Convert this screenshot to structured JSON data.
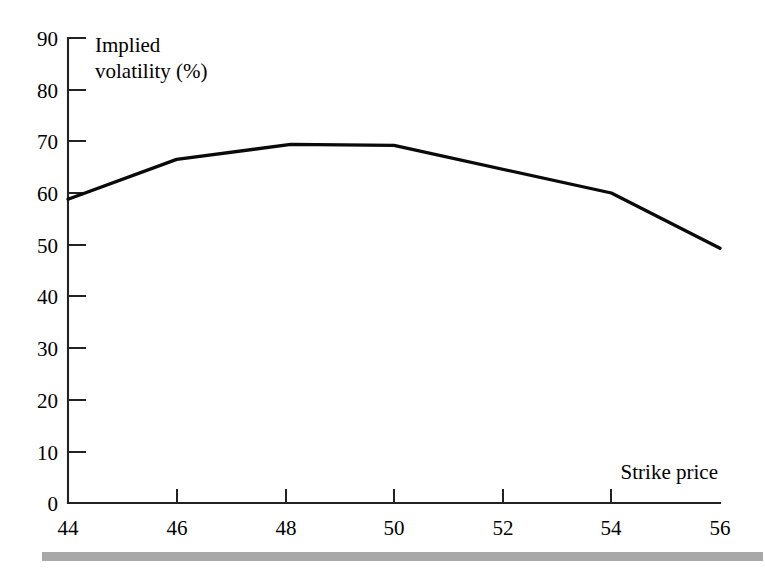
{
  "chart_data": {
    "type": "line",
    "title": "",
    "subtitle": "",
    "xlabel": "Strike price",
    "ylabel": "Implied volatility (%)",
    "ylabel_line1": "Implied",
    "ylabel_line2": "volatility (%)",
    "xlim": [
      44,
      56
    ],
    "ylim": [
      0,
      90
    ],
    "xticks": [
      44,
      46,
      48,
      50,
      52,
      54,
      56
    ],
    "yticks": [
      0,
      10,
      20,
      30,
      40,
      50,
      60,
      70,
      80,
      90
    ],
    "xtick_labels": [
      "44",
      "46",
      "48",
      "50",
      "52",
      "54",
      "56"
    ],
    "ytick_labels": [
      "0",
      "10",
      "20",
      "30",
      "40",
      "50",
      "60",
      "70",
      "80",
      "90"
    ],
    "grid": false,
    "legend": false,
    "legend_position": "none",
    "series": [
      {
        "name": "Implied volatility",
        "color": "#0a0a0a",
        "x": [
          44.0,
          46.0,
          48.1,
          50.0,
          54.0,
          56.0
        ],
        "values": [
          58.8,
          66.5,
          69.4,
          69.2,
          60.0,
          49.3
        ]
      }
    ],
    "annotations": []
  },
  "axes": {
    "y_axis_name": "y-axis",
    "x_axis_name": "x-axis",
    "tick_direction": "inward"
  },
  "footer": {
    "rule_color": "#a8a8a8"
  }
}
